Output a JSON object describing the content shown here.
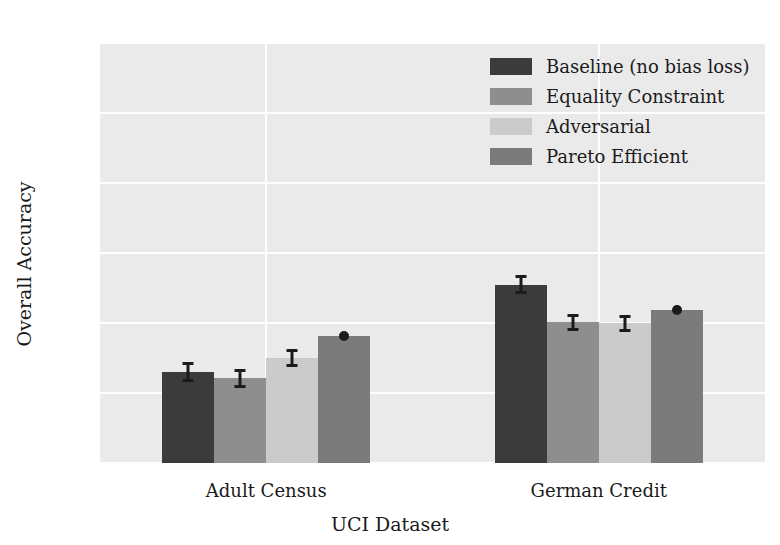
{
  "chart_data": {
    "type": "bar",
    "title": "",
    "xlabel": "UCI Dataset",
    "ylabel": "Overall Accuracy",
    "categories": [
      "Adult Census",
      "German Credit"
    ],
    "ylim": [
      0.5,
      1.1
    ],
    "yticks": [
      "0.5",
      "0.6",
      "0.7",
      "0.8",
      "0.9",
      "1.0",
      "1.1"
    ],
    "ytick_values": [
      0.5,
      0.6,
      0.7,
      0.8,
      0.9,
      1.0,
      1.1
    ],
    "grid": true,
    "legend_position": "upper right",
    "series": [
      {
        "name": "Baseline (no bias loss)",
        "color": "#3b3b3b",
        "values": [
          0.63,
          0.755
        ],
        "errors": [
          0.012,
          0.012
        ]
      },
      {
        "name": "Equality Constraint",
        "color": "#8e8e8e",
        "values": [
          0.621,
          0.701
        ],
        "errors": [
          0.011,
          0.01
        ]
      },
      {
        "name": "Adversarial",
        "color": "#cbcbcb",
        "values": [
          0.65,
          0.7
        ],
        "errors": [
          0.011,
          0.01
        ]
      },
      {
        "name": "Pareto Efficient",
        "color": "#7b7b7b",
        "values": [
          0.682,
          0.719
        ],
        "errors": [
          0.004,
          0.004
        ]
      }
    ]
  },
  "style": {
    "axes_background": "#eaeaea",
    "grid_color": "#ffffff",
    "figure_background": "#ffffff",
    "text_color": "#1a1a1a",
    "error_color": "#1b1b1b"
  }
}
